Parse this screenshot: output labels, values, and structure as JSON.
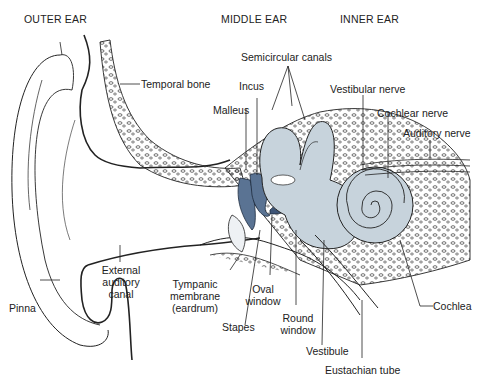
{
  "diagram": {
    "colors": {
      "structure_fill": "#c7d3dc",
      "ossicle_fill": "#5a7393",
      "line": "#222222",
      "background": "#ffffff"
    },
    "regions": {
      "outer": "OUTER EAR",
      "middle": "MIDDLE EAR",
      "inner": "INNER EAR"
    },
    "labels": {
      "temporal_bone": "Temporal bone",
      "semicircular_canals": "Semicircular canals",
      "incus": "Incus",
      "malleus": "Malleus",
      "vestibular_nerve": "Vestibular nerve",
      "cochlear_nerve": "Cochlear nerve",
      "auditory_nerve": "Auditory nerve",
      "external_auditory_canal": "External auditory canal",
      "pinna": "Pinna",
      "tympanic_membrane": "Tympanic membrane (eardrum)",
      "oval_window": "Oval window",
      "stapes": "Stapes",
      "round_window": "Round window",
      "vestibule": "Vestibule",
      "eustachian_tube": "Eustachian tube",
      "cochlea": "Cochlea"
    }
  }
}
